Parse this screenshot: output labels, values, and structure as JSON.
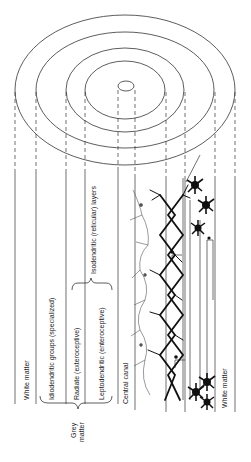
{
  "diagram": {
    "labels": {
      "white_matter_left": "White matter",
      "idiodendritic": "Idiodendritic groups (specialized)",
      "radiate": "Radiate (exteroceptive)",
      "leptodendritic": "Leptodendritic (enteroceptive)",
      "central_canal": "Central canal",
      "white_matter_right": "White matter",
      "grey_matter_line1": "Grey",
      "grey_matter_line2": "matter",
      "isodendritic": "Isodendritic (reticular) layers"
    },
    "colors": {
      "line": "#333333",
      "neuron": "#111111",
      "background": "#ffffff"
    }
  }
}
